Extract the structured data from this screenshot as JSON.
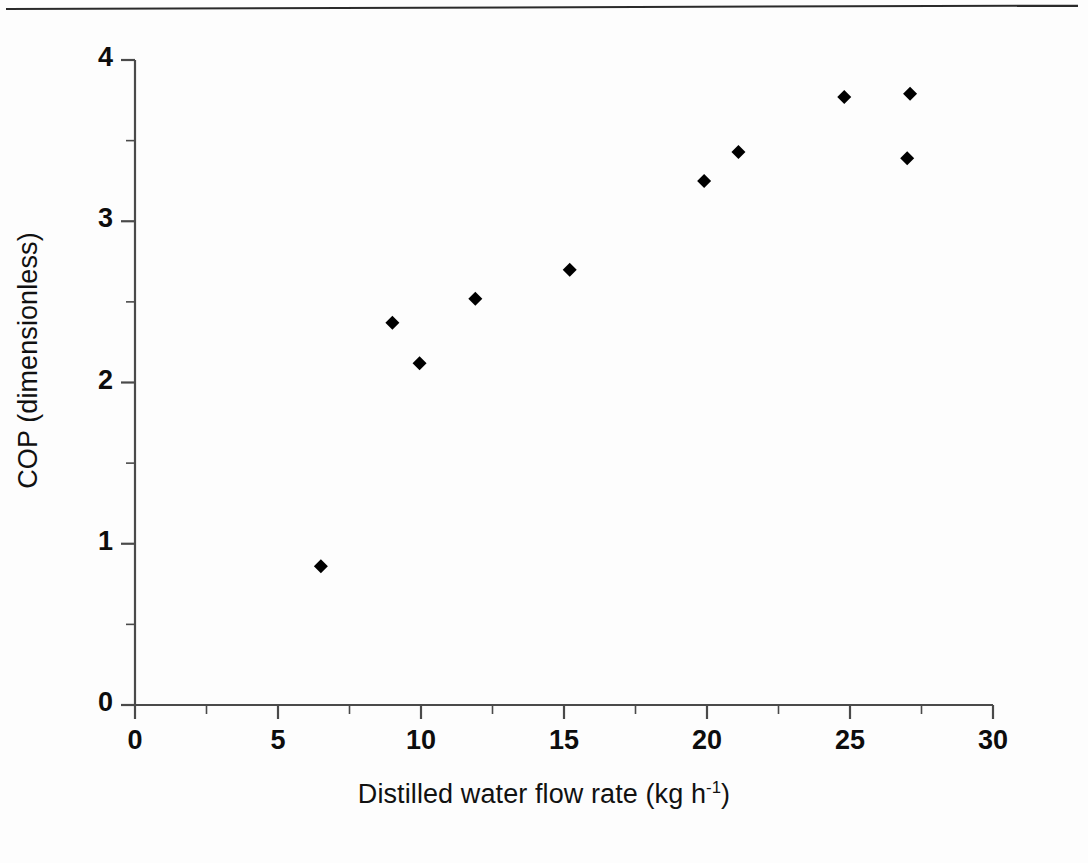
{
  "figure": {
    "background_color": "#ffffff",
    "axis_color": "#4a4a4a",
    "marker_color": "#000000",
    "top_rule": "horizontal-rule"
  },
  "chart_data": {
    "type": "scatter",
    "title": "",
    "subtitle": "",
    "xlabel": "Distilled water flow rate (kg h-1)",
    "xlabel_parts": {
      "main": "Distilled water flow rate (kg h",
      "superscript": "-1",
      "tail": ")"
    },
    "ylabel": "COP (dimensionless)",
    "xlim": [
      0,
      30
    ],
    "ylim": [
      0,
      4
    ],
    "xticks": [
      0,
      5,
      10,
      15,
      20,
      25,
      30
    ],
    "xtick_labels": [
      "0",
      "5",
      "10",
      "15",
      "20",
      "25",
      "30"
    ],
    "x_minor_tick_interval": 2.5,
    "yticks": [
      0,
      1,
      2,
      3,
      4
    ],
    "ytick_labels": [
      "0",
      "1",
      "2",
      "3",
      "4"
    ],
    "y_minor_tick_interval": 0.5,
    "grid": false,
    "legend": null,
    "legend_position": "none",
    "marker": "filled-diamond",
    "marker_size_px": 14,
    "series": [
      {
        "name": "COP",
        "points": [
          {
            "x": 6.5,
            "y": 0.86
          },
          {
            "x": 9.0,
            "y": 2.37
          },
          {
            "x": 9.95,
            "y": 2.12
          },
          {
            "x": 11.9,
            "y": 2.52
          },
          {
            "x": 15.2,
            "y": 2.7
          },
          {
            "x": 19.9,
            "y": 3.25
          },
          {
            "x": 21.1,
            "y": 3.43
          },
          {
            "x": 24.8,
            "y": 3.77
          },
          {
            "x": 27.1,
            "y": 3.79
          },
          {
            "x": 27.0,
            "y": 3.39
          }
        ]
      }
    ]
  }
}
